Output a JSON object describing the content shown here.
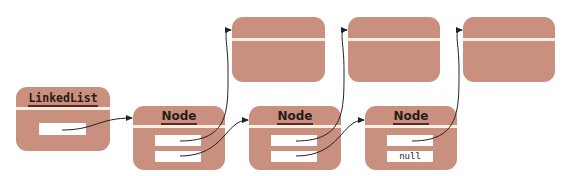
{
  "diagram": {
    "linked_list": {
      "title": "LinkedList",
      "fields": [
        ""
      ]
    },
    "nodes": [
      {
        "title": "Node",
        "fields": [
          "",
          ""
        ]
      },
      {
        "title": "Node",
        "fields": [
          "",
          ""
        ]
      },
      {
        "title": "Node",
        "fields": [
          "",
          "null"
        ]
      }
    ],
    "data_objects": [
      {
        "title": ""
      },
      {
        "title": ""
      },
      {
        "title": ""
      }
    ],
    "colors": {
      "box_fill": "#c99080",
      "divider": "#fbeee0",
      "field_fill": "#ffffff",
      "arrow": "#222222"
    }
  }
}
